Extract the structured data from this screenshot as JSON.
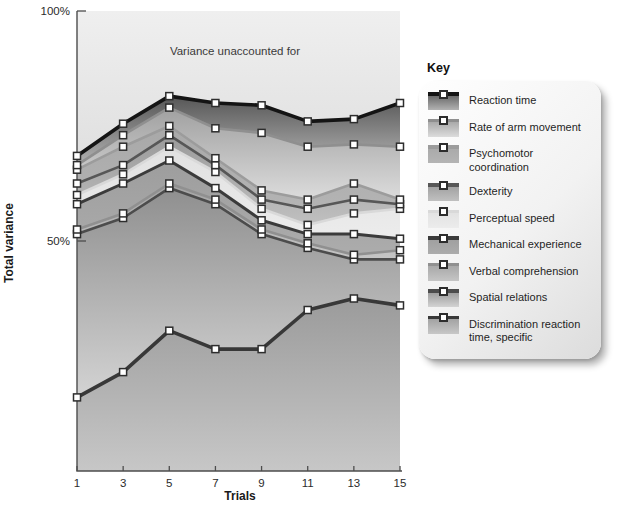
{
  "legend": {
    "title": "Key",
    "items": [
      {
        "label": "Reaction time"
      },
      {
        "label": "Rate of arm movement"
      },
      {
        "label": "Psychomotor coordination"
      },
      {
        "label": "Dexterity"
      },
      {
        "label": "Perceptual speed"
      },
      {
        "label": "Mechanical experience"
      },
      {
        "label": "Verbal comprehension"
      },
      {
        "label": "Spatial relations"
      },
      {
        "label": "Discrimination reaction time, specific"
      }
    ]
  },
  "chart_data": {
    "type": "area",
    "subtype": "stacked-percent-of-variance",
    "annotation": "Variance unaccounted for",
    "xlabel": "Trials",
    "ylabel": "Total variance",
    "x": [
      1,
      3,
      5,
      7,
      9,
      11,
      13,
      15
    ],
    "ylim": [
      0,
      100
    ],
    "y_ticks": [
      {
        "value": 100,
        "label": "100%"
      },
      {
        "value": 50,
        "label": "50%"
      }
    ],
    "grid": false,
    "legend_position": "right",
    "stacking": "values are cumulative top edges (% of total variance) of each band, listed top band to bottom band",
    "unaccounted": {
      "label": "Variance unaccounted for",
      "fill_top": "#efefef",
      "fill_bottom": "#e0e0e0"
    },
    "series": [
      {
        "name": "Reaction time",
        "values": [
          68.5,
          75.5,
          81.5,
          80.0,
          79.5,
          76.0,
          76.5,
          80.0
        ],
        "line_color": "#141414",
        "line_width": 3.6,
        "fill_top": "#565656",
        "fill_bottom": "#b2b2b2"
      },
      {
        "name": "Rate of arm movement",
        "values": [
          66.5,
          73.0,
          79.0,
          74.5,
          73.5,
          70.5,
          71.0,
          70.5
        ],
        "line_color": "#8f8f8f",
        "line_width": 2.6,
        "fill_top": "#a0a0a0",
        "fill_bottom": "#dcdcdc"
      },
      {
        "name": "Psychomotor coordination",
        "values": [
          65.5,
          70.5,
          75.0,
          68.0,
          61.0,
          59.0,
          62.5,
          59.0
        ],
        "line_color": "#9c9c9c",
        "line_width": 2.6,
        "fill_top": "#a8a8a8",
        "fill_bottom": "#b4b4b4"
      },
      {
        "name": "Dexterity",
        "values": [
          62.5,
          66.5,
          73.0,
          66.5,
          59.0,
          57.0,
          59.0,
          58.0
        ],
        "line_color": "#575757",
        "line_width": 2.6,
        "fill_top": "#9a9a9a",
        "fill_bottom": "#c0c0c0"
      },
      {
        "name": "Perceptual speed",
        "values": [
          60.0,
          64.5,
          70.5,
          65.0,
          57.0,
          53.5,
          56.0,
          57.0
        ],
        "line_color": "#d9d9d9",
        "line_width": 2.6,
        "fill_top": "#e1e1e1",
        "fill_bottom": "#ececec"
      },
      {
        "name": "Mechanical experience",
        "values": [
          58.0,
          62.5,
          67.5,
          61.5,
          54.5,
          51.5,
          51.5,
          50.5
        ],
        "line_color": "#3b3b3b",
        "line_width": 3.0,
        "fill_top": "#9d9d9d",
        "fill_bottom": "#acacac"
      },
      {
        "name": "Verbal comprehension",
        "values": [
          52.5,
          56.0,
          62.5,
          59.0,
          52.5,
          49.5,
          47.0,
          48.0
        ],
        "line_color": "#909090",
        "line_width": 2.6,
        "fill_top": "#a3a3a3",
        "fill_bottom": "#c5c5c5"
      },
      {
        "name": "Spatial relations",
        "values": [
          51.5,
          55.0,
          61.5,
          58.0,
          51.5,
          48.5,
          46.0,
          46.0
        ],
        "line_color": "#4c4c4c",
        "line_width": 2.6,
        "fill_top": "#8f8f8f",
        "fill_bottom": "#d3d3d3"
      },
      {
        "name": "Discrimination reaction time, specific",
        "values": [
          16.0,
          21.5,
          30.5,
          26.5,
          26.5,
          35.0,
          37.5,
          36.0
        ],
        "line_color": "#383838",
        "line_width": 3.6,
        "fill_top": "#9b9b9b",
        "fill_bottom": "#c7c7c7"
      }
    ]
  }
}
